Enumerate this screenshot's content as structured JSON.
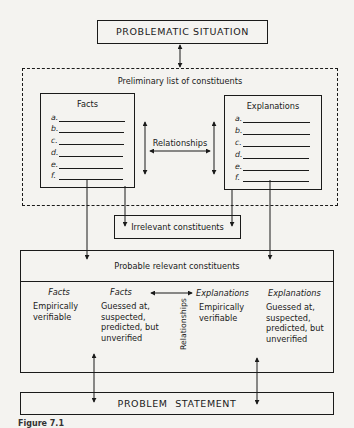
{
  "diagram": {
    "problematic_situation": "PROBLEMATIC SITUATION",
    "preliminary_list": {
      "title": "Preliminary list of constituents",
      "facts": {
        "title": "Facts",
        "items": [
          "a.",
          "b.",
          "c.",
          "d.",
          "e.",
          "f."
        ]
      },
      "explanations": {
        "title": "Explanations",
        "items": [
          "a.",
          "b.",
          "c.",
          "d.",
          "e.",
          "f."
        ]
      },
      "relationships_label": "Relationships"
    },
    "irrelevant_constituents": "Irrelevant constituents",
    "probable_relevant": {
      "title": "Probable relevant constituents",
      "columns": [
        {
          "heading": "Facts",
          "lines": [
            "Empirically",
            "verifiable"
          ]
        },
        {
          "heading": "Facts",
          "lines": [
            "Guessed at,",
            "suspected,",
            "predicted, but",
            "unverified"
          ]
        },
        {
          "heading": "Explanations",
          "lines": [
            "Empirically",
            "verifiable"
          ]
        },
        {
          "heading": "Explanations",
          "lines": [
            "Guessed at,",
            "suspected,",
            "predicted, but",
            "unverified"
          ]
        }
      ],
      "relationships_label": "Relationships"
    },
    "problem_statement": "PROBLEM STATEMENT",
    "caption": "Figure 7.1"
  }
}
